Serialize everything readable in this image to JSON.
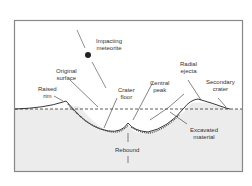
{
  "diagram": {
    "labels": {
      "impacting_meteorite": "Impacting\nmeteorite",
      "original_surface": "Original\nsurface",
      "raised_rim": "Raised\nrim",
      "crater_floor": "Crater\nfloor",
      "central_peak": "Central\npeak",
      "radial_ejecta": "Radial\nejecta",
      "secondary_crater": "Secondary\ncrater",
      "excavated_material": "Excavated\nmaterial",
      "rebound": "Rebound"
    },
    "colors": {
      "ground_fill": "#eeeeee",
      "frame": "#888888",
      "line": "#333333",
      "meteorite": "#222222"
    }
  }
}
